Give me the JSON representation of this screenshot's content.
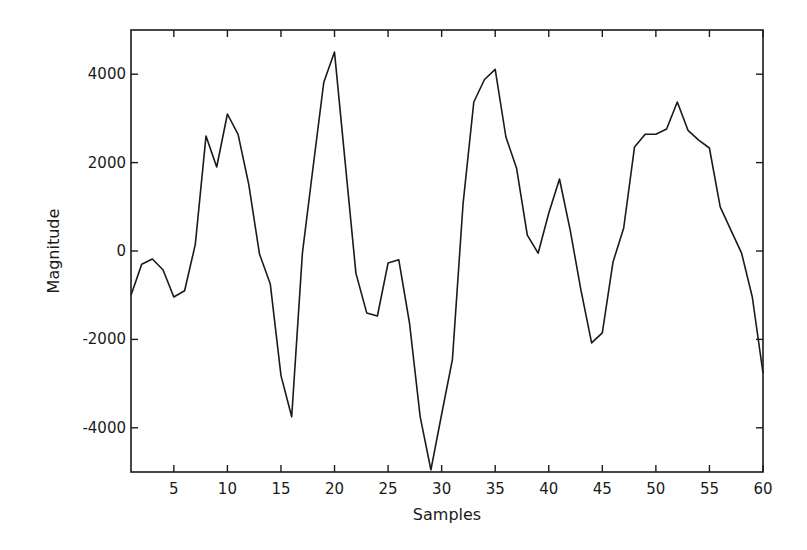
{
  "chart_data": {
    "type": "line",
    "title": "",
    "xlabel": "Samples",
    "ylabel": "Magnitude",
    "xlim": [
      1,
      60
    ],
    "ylim": [
      -5000,
      5000
    ],
    "grid": false,
    "legend": null,
    "x_ticks": [
      5,
      10,
      15,
      20,
      25,
      30,
      35,
      40,
      45,
      50,
      55,
      60
    ],
    "y_ticks": [
      -4000,
      -2000,
      0,
      2000,
      4000
    ],
    "line_color": "#1a1a1a",
    "x": [
      1,
      2,
      3,
      4,
      5,
      6,
      7,
      8,
      9,
      10,
      11,
      12,
      13,
      14,
      15,
      16,
      17,
      18,
      19,
      20,
      21,
      22,
      23,
      24,
      25,
      26,
      27,
      28,
      29,
      30,
      31,
      32,
      33,
      34,
      35,
      36,
      37,
      38,
      39,
      40,
      41,
      42,
      43,
      44,
      45,
      46,
      47,
      48,
      49,
      50,
      51,
      52,
      53,
      54,
      55,
      56,
      57,
      58,
      59,
      60
    ],
    "series": [
      {
        "name": "Magnitude",
        "values": [
          -1000,
          -300,
          -180,
          -430,
          -1040,
          -900,
          150,
          2600,
          1900,
          3100,
          2640,
          1500,
          -70,
          -750,
          -2820,
          -3750,
          -50,
          1900,
          3820,
          4500,
          2000,
          -500,
          -1400,
          -1470,
          -270,
          -200,
          -1630,
          -3750,
          -4950,
          -3700,
          -2460,
          1080,
          3370,
          3880,
          4110,
          2580,
          1870,
          360,
          -50,
          860,
          1630,
          470,
          -880,
          -2080,
          -1850,
          -250,
          520,
          2350,
          2640,
          2640,
          2760,
          3370,
          2730,
          2510,
          2330,
          1000,
          470,
          -50,
          -1040,
          -2760
        ]
      }
    ]
  }
}
